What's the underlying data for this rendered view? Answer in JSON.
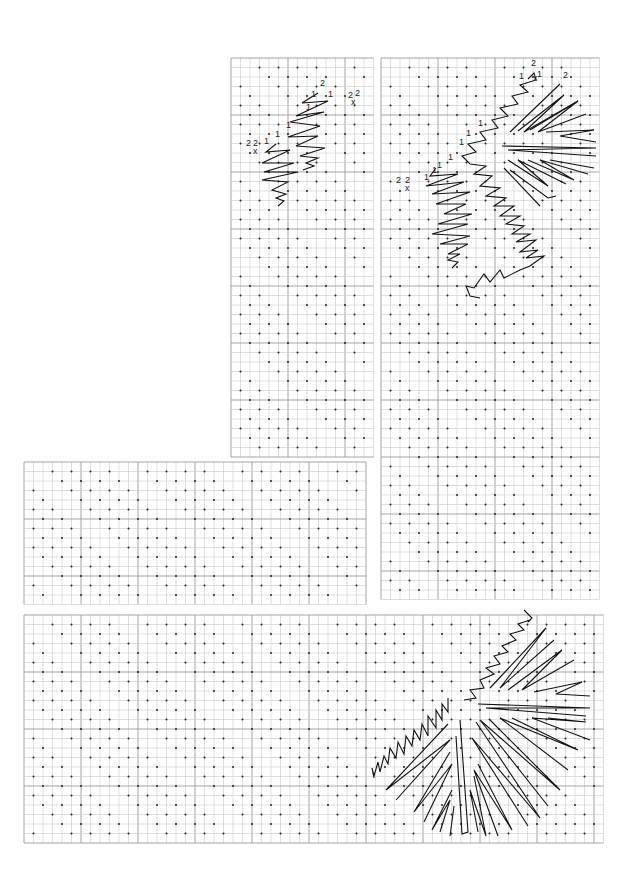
{
  "diagram": {
    "type": "embroidery-stitch-chart",
    "cell_size": 9.5,
    "major_every": 6,
    "grid_color": "#c9c9c9",
    "major_grid_color": "#9a9a9a",
    "stitch_color": "#111111",
    "panels": [
      {
        "id": "top-left",
        "x": 231,
        "y": 58,
        "w": 143,
        "h": 405
      },
      {
        "id": "right-column",
        "x": 381,
        "y": 58,
        "w": 224,
        "h": 550
      },
      {
        "id": "middle-left",
        "x": 24,
        "y": 462,
        "w": 350,
        "h": 143
      },
      {
        "id": "bottom",
        "x": 24,
        "y": 615,
        "w": 581,
        "h": 233
      }
    ],
    "labels": [
      {
        "text": "2",
        "x": 320,
        "y": 86
      },
      {
        "text": "1",
        "x": 311,
        "y": 97
      },
      {
        "text": "1",
        "x": 328,
        "y": 97
      },
      {
        "text": "2",
        "x": 348,
        "y": 98
      },
      {
        "text": "2",
        "x": 355,
        "y": 96
      },
      {
        "text": "x",
        "x": 351,
        "y": 105
      },
      {
        "text": "1",
        "x": 306,
        "y": 110
      },
      {
        "text": "1",
        "x": 286,
        "y": 128
      },
      {
        "text": "1",
        "x": 275,
        "y": 137
      },
      {
        "text": "2",
        "x": 246,
        "y": 146
      },
      {
        "text": "2",
        "x": 253,
        "y": 146
      },
      {
        "text": "x",
        "x": 253,
        "y": 154
      },
      {
        "text": "1",
        "x": 264,
        "y": 144
      },
      {
        "text": "2",
        "x": 531,
        "y": 66
      },
      {
        "text": "1",
        "x": 519,
        "y": 79
      },
      {
        "text": "1",
        "x": 537,
        "y": 77
      },
      {
        "text": "x",
        "x": 533,
        "y": 81
      },
      {
        "text": "2",
        "x": 563,
        "y": 78
      },
      {
        "text": "1",
        "x": 478,
        "y": 126
      },
      {
        "text": "1",
        "x": 466,
        "y": 136
      },
      {
        "text": "1",
        "x": 459,
        "y": 145
      },
      {
        "text": "1",
        "x": 448,
        "y": 160
      },
      {
        "text": "1",
        "x": 432,
        "y": 173
      },
      {
        "text": "1",
        "x": 437,
        "y": 168
      },
      {
        "text": "1",
        "x": 424,
        "y": 180
      },
      {
        "text": "2",
        "x": 396,
        "y": 183
      },
      {
        "text": "2",
        "x": 405,
        "y": 183
      },
      {
        "text": "x",
        "x": 405,
        "y": 191
      }
    ]
  }
}
